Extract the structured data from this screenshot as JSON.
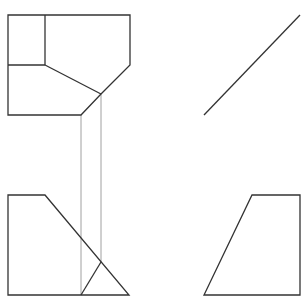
{
  "drawing": {
    "type": "orthographic-projection",
    "colors": {
      "outline": "#333333",
      "projection": "#888888",
      "background": "#ffffff"
    },
    "views": {
      "top": {
        "outline": "8,15 130,15 130,65 101,94 81,115 8,115",
        "inner_lines": [
          {
            "x1": 45,
            "y1": 15,
            "x2": 45,
            "y2": 65
          },
          {
            "x1": 8,
            "y1": 65,
            "x2": 45,
            "y2": 65
          },
          {
            "x1": 45,
            "y1": 65,
            "x2": 101,
            "y2": 94
          }
        ]
      },
      "miter": {
        "x1": 204,
        "y1": 115,
        "x2": 300,
        "y2": 15
      },
      "front": {
        "outline": "8,195 45,195 129,295 8,295",
        "inner_lines": [
          {
            "x1": 81,
            "y1": 295,
            "x2": 101,
            "y2": 262
          }
        ]
      },
      "side": {
        "outline": "252,195 300,195 300,295 204,295"
      },
      "projection_lines": [
        {
          "x1": 81,
          "y1": 115,
          "x2": 81,
          "y2": 295
        },
        {
          "x1": 101,
          "y1": 94,
          "x2": 101,
          "y2": 262
        }
      ]
    }
  }
}
